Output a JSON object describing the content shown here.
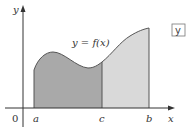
{
  "diagram": {
    "curve_label": "y = f(x)",
    "axis_labels": {
      "y": "y",
      "x": "x",
      "origin": "0"
    },
    "points": {
      "a": "a",
      "c": "c",
      "b": "b"
    },
    "corner_tag": "y",
    "colors": {
      "left_region": "#a9a9a9",
      "right_region": "#d9d9d9",
      "curve": "#555555",
      "axes": "#333333"
    }
  }
}
